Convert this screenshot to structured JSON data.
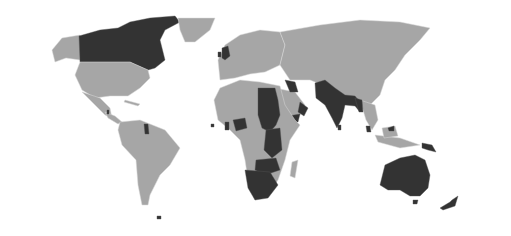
{
  "map": {
    "type": "world choropleth",
    "projection": "equirectangular (Antarctica cropped)",
    "colors": {
      "background": "#ffffff",
      "land_default": "#a6a6a6",
      "highlighted": "#333333",
      "borders": "#d8d8d8"
    },
    "highlighted_regions": [
      "Canada",
      "United Kingdom",
      "Ireland",
      "Belize",
      "Guyana",
      "Falkland Islands",
      "Jamaica",
      "Sierra Leone",
      "Ghana",
      "Nigeria",
      "Egypt",
      "Sudan",
      "South Sudan",
      "Uganda",
      "Kenya",
      "Tanzania",
      "Zambia",
      "Malawi",
      "Zimbabwe",
      "Botswana",
      "Namibia",
      "South Africa",
      "Lesotho",
      "Eswatini",
      "Iraq",
      "Kuwait",
      "Yemen",
      "Oman",
      "Pakistan",
      "India",
      "Bangladesh",
      "Sri Lanka",
      "Myanmar",
      "Malaysia",
      "Papua New Guinea",
      "Australia",
      "New Zealand"
    ]
  }
}
